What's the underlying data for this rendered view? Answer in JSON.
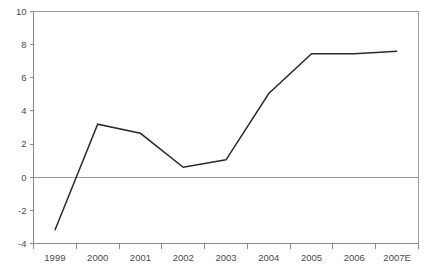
{
  "chart_data": {
    "type": "line",
    "title": "",
    "subtitle": "",
    "xlabel": "",
    "ylabel": "",
    "categories": [
      "1999",
      "2000",
      "2001",
      "2002",
      "2003",
      "2004",
      "2005",
      "2006",
      "2007E"
    ],
    "values": [
      -3.2,
      3.2,
      2.65,
      0.6,
      1.05,
      5.05,
      7.45,
      7.45,
      7.6
    ],
    "series": [
      {
        "name": "",
        "values": [
          -3.2,
          3.2,
          2.65,
          0.6,
          1.05,
          5.05,
          7.45,
          7.45,
          7.6
        ],
        "color": "#2b2b2b"
      }
    ],
    "ylim": [
      -4,
      10
    ],
    "yticks": [
      -4,
      -2,
      0,
      2,
      4,
      6,
      8,
      10
    ],
    "ytick_labels": [
      "-4",
      "-2",
      "0",
      "2",
      "4",
      "6",
      "8",
      "10"
    ],
    "xtick_labels": [
      "1999",
      "2000",
      "2001",
      "2002",
      "2003",
      "2004",
      "2005",
      "2006",
      "2007E"
    ],
    "grid": false,
    "zero_line": true,
    "legend": false,
    "legend_position": "none",
    "colors": {
      "line": "#2b2b2b",
      "axis": "#8a8a8a",
      "frame": "#9a9a9a",
      "text": "#4a4a4a",
      "background": "#ffffff"
    }
  }
}
